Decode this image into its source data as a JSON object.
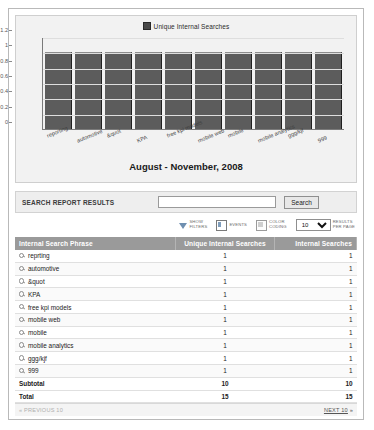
{
  "chart_data": {
    "type": "bar",
    "title": "August - November, 2008",
    "xlabel": "",
    "ylabel": "",
    "ylim": [
      0,
      1.2
    ],
    "grid": true,
    "legend_position": "top-center",
    "legend": [
      "Unique Internal Searches"
    ],
    "yticks": [
      "1.2",
      "1",
      "0.8",
      "0.6",
      "0.4",
      "0.2",
      "0"
    ],
    "categories": [
      "reporting",
      "automotive",
      "&quot",
      "KPA",
      "free kpi models",
      "mobile web",
      "mobile",
      "mobile analytics",
      "ggg/kjf",
      "999"
    ],
    "series": [
      {
        "name": "Unique Internal Searches",
        "values": [
          1,
          1,
          1,
          1,
          1,
          1,
          1,
          1,
          1,
          1
        ],
        "color": "#5c5c5c"
      }
    ]
  },
  "search": {
    "label": "SEARCH REPORT RESULTS",
    "value": "",
    "placeholder": "",
    "button_label": "Search"
  },
  "options": {
    "filters_label": "SHOW\nFILTERS",
    "events_label": "EVENTS",
    "color_coding_label": "COLOR\nCODING",
    "results_per_page_value": "10",
    "results_per_page_options": [
      "10",
      "25",
      "50",
      "100"
    ],
    "results_per_page_label": "RESULTS\nPER PAGE"
  },
  "table": {
    "headers": [
      "Internal Search Phrase",
      "Unique Internal Searches",
      "Internal Searches"
    ],
    "rows": [
      {
        "phrase": "reprting",
        "unique": "1",
        "searches": "1"
      },
      {
        "phrase": "automotive",
        "unique": "1",
        "searches": "1"
      },
      {
        "phrase": "&quot",
        "unique": "1",
        "searches": "1"
      },
      {
        "phrase": "KPA",
        "unique": "1",
        "searches": "1"
      },
      {
        "phrase": "free kpi models",
        "unique": "1",
        "searches": "1"
      },
      {
        "phrase": "mobile web",
        "unique": "1",
        "searches": "1"
      },
      {
        "phrase": "mobile",
        "unique": "1",
        "searches": "1"
      },
      {
        "phrase": "mobile analytics",
        "unique": "1",
        "searches": "1"
      },
      {
        "phrase": "ggg/kjf",
        "unique": "1",
        "searches": "1"
      },
      {
        "phrase": "999",
        "unique": "1",
        "searches": "1"
      }
    ],
    "subtotal": {
      "label": "Subtotal",
      "unique": "10",
      "searches": "10"
    },
    "total": {
      "label": "Total",
      "unique": "15",
      "searches": "15"
    }
  },
  "pager": {
    "previous_label": "« PREVIOUS 10",
    "next_label": "NEXT 10",
    "next_suffix": " »"
  },
  "colors": {
    "header_bg": "#9a9a9a",
    "bar": "#5c5c5c",
    "panel_bg": "#f2f2f2",
    "search_bg": "#eeeeee"
  }
}
